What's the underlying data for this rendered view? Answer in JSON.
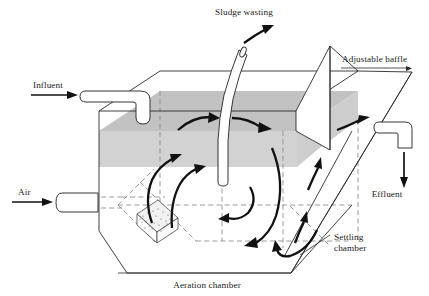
{
  "figure": {
    "background_color": "#ffffff",
    "line_color": "#2b2b2b",
    "hidden_line_color": "#8a8a8a",
    "water_surface_color": "#bfbfbf",
    "water_side_color": "#cfcfcf",
    "arrow_color": "#111111"
  },
  "labels": {
    "sludge_wasting": "Sludge wasting",
    "adjustable_baffle": "Adjustable baffle",
    "influent": "Influent",
    "air": "Air",
    "effluent": "Effluent",
    "settling_chamber_line1": "Settling",
    "settling_chamber_line2": "chamber",
    "aeration_chamber": "Aeration chamber"
  },
  "components": [
    {
      "name": "influent-pipe",
      "label": "Influent",
      "position": "upper-left",
      "flow": "in"
    },
    {
      "name": "air-pipe",
      "label": "Air",
      "position": "lower-left",
      "flow": "in"
    },
    {
      "name": "sludge-wasting-pipe",
      "label": "Sludge wasting",
      "position": "top-center",
      "flow": "out"
    },
    {
      "name": "effluent-pipe",
      "label": "Effluent",
      "position": "right",
      "flow": "out"
    },
    {
      "name": "adjustable-baffle",
      "label": "Adjustable baffle",
      "position": "right-interior"
    },
    {
      "name": "settling-chamber",
      "label": "Settling chamber",
      "position": "right"
    },
    {
      "name": "aeration-chamber",
      "label": "Aeration chamber",
      "position": "bottom-center"
    },
    {
      "name": "air-diffuser",
      "label": "",
      "position": "bottom-left-interior"
    }
  ],
  "flow_arrows": {
    "count": 11,
    "description": "Circulating mixed-liquor roll pattern in the aeration chamber plus surface flow toward the settling chamber and effluent weir"
  }
}
